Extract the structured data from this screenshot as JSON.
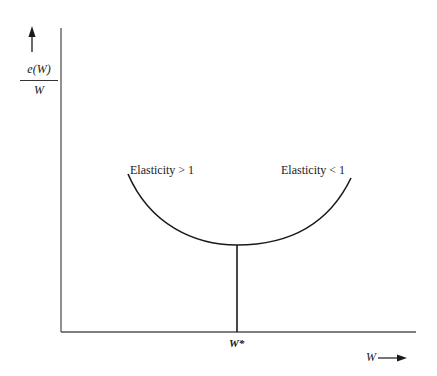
{
  "diagram": {
    "y_axis_label": {
      "numerator": "e(W)",
      "denominator": "W"
    },
    "x_axis_label": "W",
    "curve_labels": {
      "left": "Elasticity > 1",
      "right": "Elasticity < 1"
    },
    "minimum_point_label": "W*",
    "colors": {
      "line": "#1a1a1a",
      "axis": "#555555"
    }
  }
}
